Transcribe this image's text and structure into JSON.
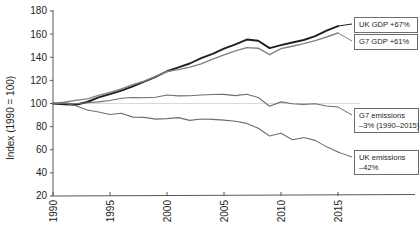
{
  "chart_data": {
    "type": "line",
    "title": "",
    "subtitle": "",
    "xlabel": "",
    "ylabel": "Index (1990 = 100)",
    "xlim": [
      1990,
      2015
    ],
    "ylim": [
      20,
      180
    ],
    "grid": "horizontal reference line at 100 only",
    "legend_position": "right-inline callout boxes",
    "x_ticks": [
      1990,
      1995,
      2000,
      2005,
      2010,
      2015
    ],
    "x_tick_labels": [
      "1990",
      "1995",
      "2000",
      "2005",
      "2010",
      "2015"
    ],
    "y_ticks": [
      20,
      40,
      60,
      80,
      100,
      120,
      140,
      160,
      180
    ],
    "y_tick_labels": [
      "20",
      "40",
      "60",
      "80",
      "100",
      "120",
      "140",
      "160",
      "180"
    ],
    "x": [
      1990,
      1991,
      1992,
      1993,
      1994,
      1995,
      1996,
      1997,
      1998,
      1999,
      2000,
      2001,
      2002,
      2003,
      2004,
      2005,
      2006,
      2007,
      2008,
      2009,
      2010,
      2011,
      2012,
      2013,
      2014,
      2015
    ],
    "series": [
      {
        "name": "UK GDP",
        "color": "#231f20",
        "width": 1.9,
        "values": [
          100,
          99.2,
          98.9,
          101.3,
          105.3,
          108.1,
          111.1,
          114.9,
          118.9,
          123.1,
          127.9,
          131.3,
          134.6,
          139.2,
          143.0,
          147.4,
          151.2,
          155.3,
          154.3,
          147.9,
          150.5,
          152.8,
          154.9,
          158.2,
          163.0,
          167.0
        ],
        "end_value": 167,
        "change_pct": 67
      },
      {
        "name": "G7 GDP",
        "color": "#808285",
        "width": 1.4,
        "values": [
          100,
          101.1,
          102.7,
          104.0,
          107.0,
          109.5,
          112.6,
          116.2,
          119.3,
          123.4,
          127.7,
          129.3,
          131.4,
          134.3,
          138.4,
          142.0,
          145.5,
          148.3,
          147.8,
          142.3,
          147.4,
          149.5,
          151.8,
          154.4,
          157.5,
          161.0
        ],
        "end_value": 161,
        "change_pct": 61
      },
      {
        "name": "G7 emissions",
        "color": "#6d6e71",
        "width": 1.1,
        "values": [
          100,
          100.3,
          99.8,
          100.7,
          101.4,
          102.6,
          104.6,
          105.2,
          105.0,
          105.4,
          107.3,
          106.6,
          106.7,
          107.4,
          107.8,
          107.9,
          106.8,
          108.0,
          105.2,
          97.6,
          101.4,
          99.8,
          99.2,
          99.8,
          97.8,
          97.0
        ],
        "end_value": 97,
        "change_pct": -3
      },
      {
        "name": "UK emissions",
        "color": "#6d6e71",
        "width": 1.1,
        "values": [
          100,
          100.4,
          98.0,
          94.4,
          92.6,
          90.5,
          91.6,
          88.2,
          88.0,
          86.5,
          86.9,
          87.8,
          85.4,
          86.6,
          86.3,
          85.6,
          84.7,
          82.8,
          78.6,
          71.9,
          74.2,
          68.6,
          70.6,
          68.1,
          62.5,
          58.0
        ],
        "end_value": 58,
        "change_pct": -42
      }
    ],
    "annotations": [
      {
        "id": "uk-gdp",
        "line1": "UK GDP +67%",
        "line2": ""
      },
      {
        "id": "g7-gdp",
        "line1": "G7 GDP +61%",
        "line2": ""
      },
      {
        "id": "g7-emissions",
        "line1": "G7 emissions",
        "line2": "–3% (1990–2015)"
      },
      {
        "id": "uk-emissions",
        "line1": "UK emissions",
        "line2": "–42%"
      }
    ]
  }
}
